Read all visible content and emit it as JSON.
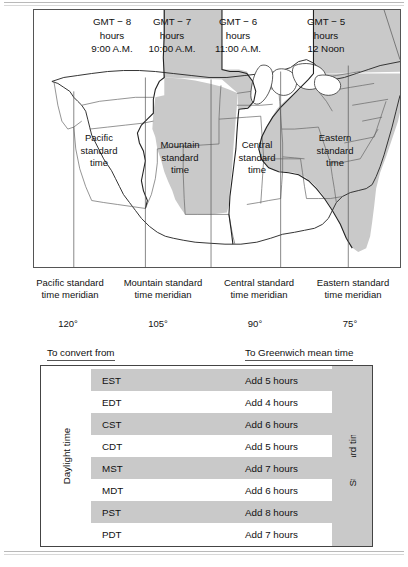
{
  "map": {
    "zone_headers": [
      {
        "offset": "GMT − 8",
        "unit": "hours",
        "local_time": "9:00 A.M.",
        "shaded": false
      },
      {
        "offset": "GMT − 7",
        "unit": "hours",
        "local_time": "10:00 A.M.",
        "shaded": true
      },
      {
        "offset": "GMT − 6",
        "unit": "hours",
        "local_time": "11:00 A.M.",
        "shaded": false
      },
      {
        "offset": "GMT − 5",
        "unit": "hours",
        "local_time": "12 Noon",
        "shaded": true
      }
    ],
    "zone_names": [
      {
        "line1": "Pacific",
        "line2": "standard",
        "line3": "time"
      },
      {
        "line1": "Mountain",
        "line2": "standard",
        "line3": "time"
      },
      {
        "line1": "Central",
        "line2": "standard",
        "line3": "time"
      },
      {
        "line1": "Eastern",
        "line2": "standard",
        "line3": "time"
      }
    ],
    "meridians": [
      {
        "line1": "Pacific standard",
        "line2": "time meridian",
        "degrees": "120°"
      },
      {
        "line1": "Mountain standard",
        "line2": "time meridian",
        "degrees": "105°"
      },
      {
        "line1": "Central standard",
        "line2": "time meridian",
        "degrees": "90°"
      },
      {
        "line1": "Eastern standard",
        "line2": "time meridian",
        "degrees": "75°"
      }
    ]
  },
  "table": {
    "caption_left": "To convert from",
    "caption_right": "To Greenwich mean time",
    "side_label_left": "Daylight time",
    "side_label_right": "Standard time",
    "rows": [
      {
        "abbr": "EST",
        "conversion": "Add 5 hours",
        "shaded": true
      },
      {
        "abbr": "EDT",
        "conversion": "Add 4 hours",
        "shaded": false
      },
      {
        "abbr": "CST",
        "conversion": "Add 6 hours",
        "shaded": true
      },
      {
        "abbr": "CDT",
        "conversion": "Add 5 hours",
        "shaded": false
      },
      {
        "abbr": "MST",
        "conversion": "Add 7 hours",
        "shaded": true
      },
      {
        "abbr": "MDT",
        "conversion": "Add 6 hours",
        "shaded": false
      },
      {
        "abbr": "PST",
        "conversion": "Add 8 hours",
        "shaded": true
      },
      {
        "abbr": "PDT",
        "conversion": "Add 7 hours",
        "shaded": false
      }
    ]
  },
  "colors": {
    "shade_gray": "#c9c9c9",
    "line": "#555555",
    "text": "#111111",
    "page_background": "#ffffff"
  }
}
